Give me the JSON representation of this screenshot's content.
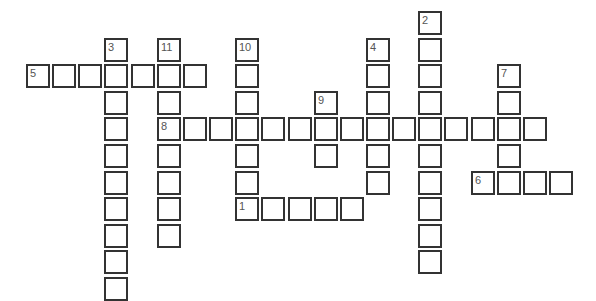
{
  "puzzle": {
    "type": "crossword",
    "grid": {
      "origin_x": 26,
      "origin_y": 11,
      "pitch_x": 26.15,
      "pitch_y": 26.6
    },
    "words": [
      {
        "number": "1",
        "direction": "across",
        "col": 8,
        "row": 7,
        "length": 5
      },
      {
        "number": "2",
        "direction": "down",
        "col": 15,
        "row": 0,
        "length": 10
      },
      {
        "number": "3",
        "direction": "down",
        "col": 3,
        "row": 1,
        "length": 10
      },
      {
        "number": "4",
        "direction": "down",
        "col": 13,
        "row": 1,
        "length": 6
      },
      {
        "number": "5",
        "direction": "across",
        "col": 0,
        "row": 2,
        "length": 7
      },
      {
        "number": "6",
        "direction": "across",
        "col": 17,
        "row": 6,
        "length": 4
      },
      {
        "number": "7",
        "direction": "down",
        "col": 18,
        "row": 2,
        "length": 5
      },
      {
        "number": "8",
        "direction": "across",
        "col": 5,
        "row": 4,
        "length": 15
      },
      {
        "number": "9",
        "direction": "down",
        "col": 11,
        "row": 3,
        "length": 3
      },
      {
        "number": "10",
        "direction": "down",
        "col": 8,
        "row": 1,
        "length": 7
      },
      {
        "number": "11",
        "direction": "down",
        "col": 5,
        "row": 1,
        "length": 8
      }
    ]
  }
}
